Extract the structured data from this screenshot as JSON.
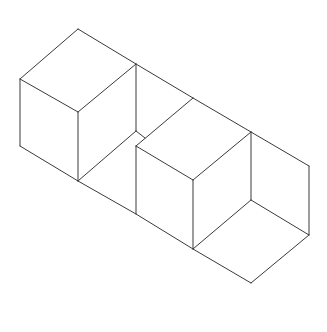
{
  "diagram": {
    "title": "",
    "stroke_color": "#3a3a3a",
    "background": "#ffffff",
    "shapes": [
      {
        "name": "left-cube",
        "edges": [
          [
            78,
            29,
            136,
            64
          ],
          [
            78,
            29,
            20,
            79
          ],
          [
            20,
            79,
            78,
            112
          ],
          [
            78,
            112,
            136,
            64
          ],
          [
            20,
            79,
            20,
            146
          ],
          [
            78,
            112,
            78,
            181
          ],
          [
            136,
            64,
            136,
            131
          ],
          [
            20,
            146,
            78,
            181
          ]
        ]
      },
      {
        "name": "middle-open-box",
        "edges": [
          [
            136,
            64,
            193,
            98
          ],
          [
            78,
            181,
            136,
            131
          ],
          [
            136,
            131,
            145,
            138
          ],
          [
            78,
            181,
            136,
            214
          ]
        ]
      },
      {
        "name": "front-cube",
        "edges": [
          [
            136,
            146,
            193,
            98
          ],
          [
            193,
            98,
            251,
            132
          ],
          [
            136,
            146,
            193,
            180
          ],
          [
            193,
            180,
            251,
            132
          ],
          [
            136,
            146,
            136,
            214
          ],
          [
            193,
            180,
            193,
            249
          ],
          [
            251,
            132,
            251,
            200
          ],
          [
            136,
            214,
            193,
            249
          ]
        ]
      },
      {
        "name": "right-open-box",
        "edges": [
          [
            251,
            132,
            309,
            166
          ],
          [
            309,
            166,
            309,
            235
          ],
          [
            251,
            200,
            309,
            235
          ],
          [
            193,
            249,
            251,
            200
          ],
          [
            193,
            249,
            251,
            283
          ],
          [
            251,
            283,
            309,
            235
          ]
        ]
      }
    ]
  }
}
